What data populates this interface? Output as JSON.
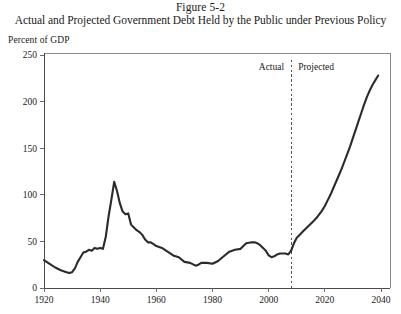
{
  "figure": {
    "number": "Figure 5-2",
    "caption": "Actual and Projected Government Debt Held by the Public under Previous Policy",
    "unit_label": "Percent of GDP"
  },
  "annotations": {
    "actual_label": "Actual",
    "projected_label": "Projected",
    "divider_year": 2008
  },
  "axes": {
    "y_ticks": [
      "0",
      "50",
      "100",
      "150",
      "200",
      "250"
    ],
    "x_ticks": [
      "1920",
      "1940",
      "1960",
      "1980",
      "2000",
      "2020",
      "2040"
    ]
  },
  "colors": {
    "line": "#2b2b2b",
    "frame": "#8a8a8a",
    "divider": "#555555",
    "text": "#1a1a1a",
    "background": "#ffffff"
  },
  "chart_data": {
    "type": "line",
    "title": "Actual and Projected Government Debt Held by the Public under Previous Policy",
    "subtitle": "Figure 5-2",
    "xlabel": "",
    "ylabel": "Percent of GDP",
    "xlim": [
      1920,
      2040
    ],
    "ylim": [
      0,
      250
    ],
    "xtick_interval": 20,
    "ytick_interval": 50,
    "grid": false,
    "legend": "none",
    "annotations": [
      {
        "text": "Actual",
        "x": 2005,
        "y": 238,
        "align": "right"
      },
      {
        "text": "Projected",
        "x": 2011,
        "y": 238,
        "align": "left"
      },
      {
        "text": "vertical dashed divider",
        "x": 2008,
        "type": "vline"
      }
    ],
    "series": [
      {
        "name": "Debt Held by the Public (Actual)",
        "segment": "actual",
        "x": [
          1920,
          1922,
          1924,
          1926,
          1928,
          1929,
          1930,
          1931,
          1932,
          1933,
          1934,
          1935,
          1936,
          1937,
          1938,
          1939,
          1940,
          1941,
          1942,
          1943,
          1944,
          1945,
          1946,
          1947,
          1948,
          1949,
          1950,
          1951,
          1952,
          1953,
          1954,
          1955,
          1956,
          1957,
          1958,
          1959,
          1960,
          1962,
          1964,
          1966,
          1968,
          1970,
          1972,
          1974,
          1975,
          1976,
          1978,
          1980,
          1982,
          1984,
          1986,
          1988,
          1990,
          1992,
          1994,
          1995,
          1996,
          1997,
          1998,
          1999,
          2000,
          2001,
          2002,
          2003,
          2004,
          2005,
          2006,
          2007,
          2008
        ],
        "y": [
          30,
          26,
          22,
          19,
          17,
          16,
          17,
          21,
          28,
          33,
          38,
          39,
          41,
          40,
          43,
          42,
          43,
          42,
          55,
          77,
          95,
          114,
          104,
          91,
          82,
          79,
          80,
          68,
          65,
          62,
          60,
          57,
          52,
          49,
          49,
          47,
          45,
          43,
          39,
          35,
          33,
          28,
          27,
          24,
          25,
          27,
          27,
          26,
          29,
          34,
          39,
          41,
          42,
          48,
          49,
          49,
          48,
          46,
          43,
          40,
          35,
          33,
          34,
          36,
          37,
          37,
          37,
          36,
          40
        ]
      },
      {
        "name": "Debt Held by the Public (Projected)",
        "segment": "projected",
        "x": [
          2008,
          2009,
          2010,
          2011,
          2012,
          2013,
          2014,
          2015,
          2016,
          2017,
          2018,
          2019,
          2020,
          2021,
          2022,
          2023,
          2024,
          2025,
          2026,
          2027,
          2028,
          2029,
          2030,
          2031,
          2032,
          2033,
          2034,
          2035,
          2036,
          2037,
          2038,
          2039
        ],
        "y": [
          40,
          48,
          54,
          57,
          60,
          63,
          66,
          69,
          72,
          75,
          79,
          83,
          88,
          94,
          100,
          107,
          114,
          121,
          128,
          136,
          144,
          152,
          161,
          170,
          179,
          188,
          197,
          205,
          212,
          218,
          223,
          228
        ]
      }
    ]
  }
}
